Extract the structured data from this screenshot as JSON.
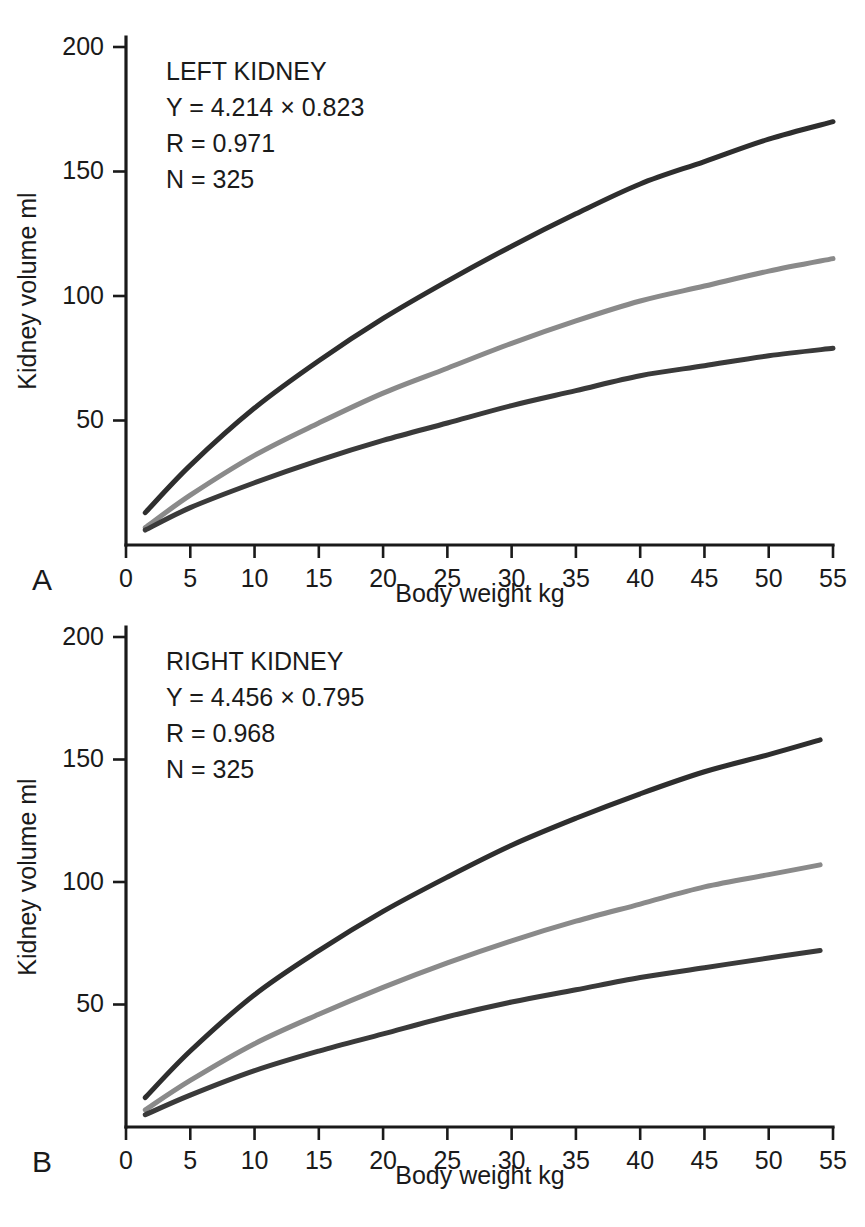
{
  "figure": {
    "panels": [
      {
        "letter": "A",
        "annotation": {
          "title": "LEFT KIDNEY",
          "equation": "Y = 4.214 × 0.823",
          "r": "R = 0.971",
          "n": "N = 325"
        }
      },
      {
        "letter": "B",
        "annotation": {
          "title": "RIGHT KIDNEY",
          "equation": "Y = 4.456 × 0.795",
          "r": "R = 0.968",
          "n": "N = 325"
        }
      }
    ]
  },
  "chart_data": [
    {
      "type": "line",
      "title": "LEFT KIDNEY",
      "panel": "A",
      "xlabel": "Body weight kg",
      "ylabel": "Kidney volume ml",
      "xlim": [
        0,
        55
      ],
      "ylim": [
        0,
        200
      ],
      "xticks": [
        0,
        5,
        10,
        15,
        20,
        25,
        30,
        35,
        40,
        45,
        50,
        55
      ],
      "yticks": [
        0,
        50,
        100,
        150,
        200
      ],
      "grid": false,
      "legend": "none",
      "annotations": [
        "LEFT KIDNEY",
        "Y = 4.214 × 0.823",
        "R = 0.971",
        "N = 325"
      ],
      "x": [
        1.5,
        5,
        10,
        15,
        20,
        25,
        30,
        35,
        40,
        45,
        50,
        55
      ],
      "series": [
        {
          "name": "upper-prediction-band",
          "color": "#2e2e2e",
          "values": [
            13,
            32,
            55,
            74,
            91,
            106,
            120,
            133,
            145,
            154,
            163,
            170
          ]
        },
        {
          "name": "mean-regression",
          "color": "#8a8a8a",
          "values": [
            7,
            20,
            36,
            49,
            61,
            71,
            81,
            90,
            98,
            104,
            110,
            115
          ]
        },
        {
          "name": "lower-prediction-band",
          "color": "#3a3a3a",
          "values": [
            6,
            15,
            25,
            34,
            42,
            49,
            56,
            62,
            68,
            72,
            76,
            79
          ]
        }
      ]
    },
    {
      "type": "line",
      "title": "RIGHT KIDNEY",
      "panel": "B",
      "xlabel": "Body weight kg",
      "ylabel": "Kidney volume ml",
      "xlim": [
        0,
        55
      ],
      "ylim": [
        0,
        200
      ],
      "xticks": [
        0,
        5,
        10,
        15,
        20,
        25,
        30,
        35,
        40,
        45,
        50,
        55
      ],
      "yticks": [
        0,
        50,
        100,
        150,
        200
      ],
      "grid": false,
      "legend": "none",
      "annotations": [
        "RIGHT KIDNEY",
        "Y = 4.456 × 0.795",
        "R = 0.968",
        "N = 325"
      ],
      "x": [
        1.5,
        5,
        10,
        15,
        20,
        25,
        30,
        35,
        40,
        45,
        50,
        54
      ],
      "series": [
        {
          "name": "upper-prediction-band",
          "color": "#2e2e2e",
          "values": [
            12,
            31,
            54,
            72,
            88,
            102,
            115,
            126,
            136,
            145,
            152,
            158
          ]
        },
        {
          "name": "mean-regression",
          "color": "#8a8a8a",
          "values": [
            7,
            19,
            34,
            46,
            57,
            67,
            76,
            84,
            91,
            98,
            103,
            107
          ]
        },
        {
          "name": "lower-prediction-band",
          "color": "#3a3a3a",
          "values": [
            5,
            13,
            23,
            31,
            38,
            45,
            51,
            56,
            61,
            65,
            69,
            72
          ]
        }
      ]
    }
  ]
}
